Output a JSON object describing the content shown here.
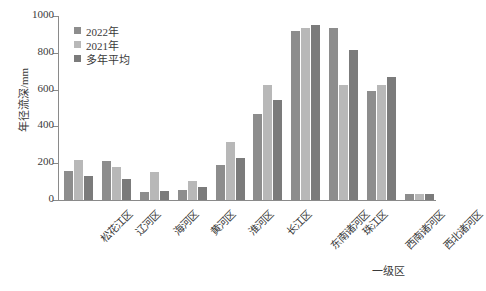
{
  "chart_data": {
    "type": "bar",
    "title": "",
    "xlabel": "一级区",
    "ylabel": "年径流深/mm",
    "ylim": [
      0,
      1000
    ],
    "yticks": [
      0,
      200,
      400,
      600,
      800,
      1000
    ],
    "grid": false,
    "legend_position": "top-left",
    "categories": [
      "松花江区",
      "辽河区",
      "海河区",
      "黄河区",
      "淮河区",
      "长江区",
      "东南诸河区",
      "珠江区",
      "西南诸河区",
      "西北诸河区"
    ],
    "series": [
      {
        "name": "2022年",
        "color": "#8d8d8d",
        "values": [
          160,
          210,
          45,
          55,
          190,
          470,
          920,
          935,
          595,
          35
        ]
      },
      {
        "name": "2021年",
        "color": "#b8b8b8",
        "values": [
          220,
          180,
          150,
          105,
          315,
          625,
          935,
          625,
          625,
          35
        ]
      },
      {
        "name": "多年平均",
        "color": "#7b7b7b",
        "values": [
          130,
          115,
          50,
          70,
          230,
          545,
          950,
          815,
          670,
          35
        ]
      }
    ]
  },
  "axis": {
    "y_title": "年径流深/mm",
    "x_title": "一级区",
    "tick_labels": [
      "0",
      "200",
      "400",
      "600",
      "800",
      "1000"
    ]
  },
  "legend": {
    "items": [
      {
        "label": "2022年",
        "color": "#8d8d8d"
      },
      {
        "label": "2021年",
        "color": "#b8b8b8"
      },
      {
        "label": "多年平均",
        "color": "#7b7b7b"
      }
    ]
  }
}
